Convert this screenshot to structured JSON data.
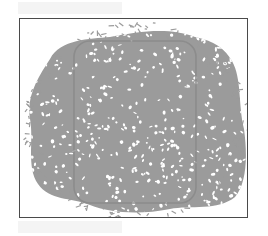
{
  "figure": {
    "colors": {
      "background": "#ffffff",
      "frame_border": "#4a4a4a",
      "structure": "#9b9b9b",
      "unit_cell_outline": "#8c8c8c"
    }
  }
}
